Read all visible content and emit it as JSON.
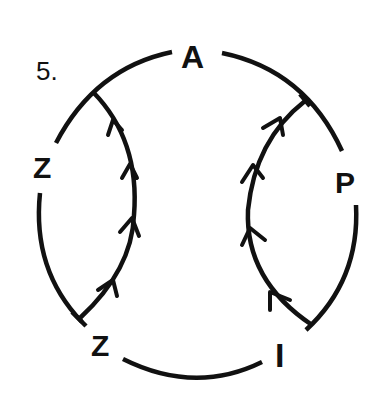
{
  "puzzle": {
    "number_label": "5.",
    "letters": {
      "top": "A",
      "right": "P",
      "bottom_right": "I",
      "bottom_left": "Z",
      "left": "Z"
    },
    "ink_color": "#111111",
    "background_color": "#ffffff"
  }
}
